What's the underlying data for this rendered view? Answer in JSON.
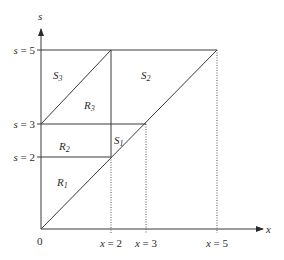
{
  "axes": {
    "x_label": "x",
    "y_label": "s",
    "origin_label": "0"
  },
  "y_ticks": [
    {
      "var": "s",
      "eq": " = ",
      "val": "5"
    },
    {
      "var": "s",
      "eq": " = ",
      "val": "3"
    },
    {
      "var": "s",
      "eq": " = ",
      "val": "2"
    }
  ],
  "x_ticks": [
    {
      "var": "x",
      "eq": " = ",
      "val": "2"
    },
    {
      "var": "x",
      "eq": " = ",
      "val": "3"
    },
    {
      "var": "x",
      "eq": " = ",
      "val": "5"
    }
  ],
  "regions": [
    {
      "letter": "S",
      "sub": "3"
    },
    {
      "letter": "R",
      "sub": "3"
    },
    {
      "letter": "S",
      "sub": "2"
    },
    {
      "letter": "R",
      "sub": "2"
    },
    {
      "letter": "S",
      "sub": "1"
    },
    {
      "letter": "R",
      "sub": "1"
    }
  ],
  "colors": {
    "line": "#3a3a3a",
    "background": "#ffffff"
  }
}
